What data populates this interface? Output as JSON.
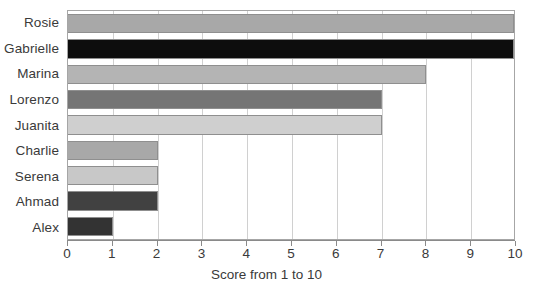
{
  "chart_data": {
    "type": "bar",
    "orientation": "horizontal",
    "title": "",
    "xlabel": "Score from 1 to 10",
    "ylabel": "",
    "xlim": [
      0,
      10
    ],
    "ylim": null,
    "grid": true,
    "legend": null,
    "xticks": [
      "0",
      "1",
      "2",
      "3",
      "4",
      "5",
      "6",
      "7",
      "8",
      "9",
      "10"
    ],
    "categories": [
      "Rosie",
      "Gabrielle",
      "Marina",
      "Lorenzo",
      "Juanita",
      "Charlie",
      "Serena",
      "Ahmad",
      "Alex"
    ],
    "values": [
      10,
      10,
      8,
      7,
      7,
      2,
      2,
      2,
      1
    ],
    "colors": [
      "#a8a8a8",
      "#0d0d0d",
      "#b4b4b4",
      "#757575",
      "#cfcfcf",
      "#a8a8a8",
      "#c8c8c8",
      "#414141",
      "#333333"
    ],
    "bar_border_color": "#8f8f8f",
    "axis_color": "#8a8a8a",
    "grid_color": "#d0d0d0",
    "text_color": "#3a3a3a",
    "background": "#ffffff"
  }
}
